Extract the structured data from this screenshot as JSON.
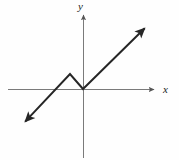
{
  "figure": {
    "title": "",
    "background_color": "#fefefe",
    "width": 179,
    "height": 160
  },
  "axes": {
    "x_label": "x",
    "y_label": "y",
    "axis_color": "#7a7a7a",
    "x_axis": {
      "name": "x-axis",
      "y_position": 89,
      "x_start": 8,
      "x_end": 156,
      "arrow": "right"
    },
    "y_axis": {
      "name": "y-axis",
      "x_position": 83,
      "y_start": 158,
      "y_end": 13,
      "arrow": "up"
    },
    "origin": {
      "x": 83,
      "y": 89
    }
  },
  "chart_data": {
    "type": "line",
    "title": "",
    "xlabel": "x",
    "ylabel": "y",
    "grid": false,
    "legend": null,
    "curve_color": "#262626",
    "series": [
      {
        "name": "piecewise-linear-graph",
        "arrow_start": true,
        "arrow_end": true,
        "points_px": [
          {
            "x": 22,
            "y": 125
          },
          {
            "x": 70,
            "y": 74
          },
          {
            "x": 83,
            "y": 89
          },
          {
            "x": 148,
            "y": 25
          }
        ],
        "points_data": [
          {
            "x": -5.5,
            "y": -3.0
          },
          {
            "x": -1.0,
            "y": 1.0
          },
          {
            "x": 0.0,
            "y": 0.0
          },
          {
            "x": 5.5,
            "y": 5.0
          }
        ],
        "vertices": [
          {
            "name": "local-maximum",
            "x": -1.0,
            "y": 1.0
          },
          {
            "name": "local-minimum-at-origin",
            "x": 0.0,
            "y": 0.0
          }
        ]
      }
    ],
    "xlim": [
      -7.0,
      6.5
    ],
    "ylim": [
      -5.5,
      6.0
    ]
  }
}
